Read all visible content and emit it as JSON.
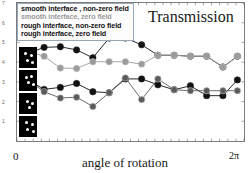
{
  "chart": {
    "title": "Transmission",
    "xlabel": "angle of rotation",
    "x_tick_min": "0",
    "x_tick_max": "2π",
    "ylabel": ""
  },
  "legend": {
    "entries": [
      {
        "label": "smooth interface ,  non-zero field",
        "color": "#111111"
      },
      {
        "label": "smooth interface, zero field",
        "color": "#9b9b9b"
      },
      {
        "label": "rough interface, non-zero field",
        "color": "#111111"
      },
      {
        "label": "rough interface, zero field",
        "color": "#4a4a4a"
      }
    ]
  },
  "insets": {
    "caption": "speckle-pattern thumbnails",
    "items": [
      {
        "name": "speckle-inset-1"
      },
      {
        "name": "speckle-inset-2"
      },
      {
        "name": "speckle-inset-3"
      },
      {
        "name": "speckle-inset-4"
      }
    ]
  },
  "chart_data": {
    "type": "line",
    "title": "Transmission",
    "xlabel": "angle of rotation",
    "ylabel": "",
    "xlim": [
      0,
      6.2832
    ],
    "ylim": [
      0,
      7
    ],
    "xticks": [
      0,
      6.2832
    ],
    "xticklabels": [
      "0",
      "2π"
    ],
    "yticks": [
      1,
      2,
      3,
      4,
      5,
      6,
      7
    ],
    "yticklabels": [
      "1",
      "2",
      "3",
      "4",
      "5",
      "6",
      "7"
    ],
    "grid": false,
    "legend_position": "upper-left",
    "x": [
      0.3,
      0.75,
      1.2,
      1.65,
      2.1,
      2.55,
      3.0,
      3.45,
      3.9,
      4.35,
      4.8,
      5.25,
      5.7,
      6.1
    ],
    "series": [
      {
        "name": "smooth interface ,  non-zero field",
        "color": "#111111",
        "marker": "circle",
        "values": [
          4.45,
          4.75,
          4.78,
          4.62,
          4.22,
          5.22,
          5.22,
          4.88,
          4.35,
          4.35,
          4.3,
          4.3,
          3.75,
          4.3
        ]
      },
      {
        "name": "smooth interface, zero field",
        "color": "#9b9b9b",
        "marker": "circle",
        "values": [
          4.55,
          4.3,
          3.7,
          3.68,
          4.02,
          4.02,
          4.02,
          3.9,
          4.35,
          4.35,
          4.3,
          4.3,
          3.75,
          4.3
        ]
      },
      {
        "name": "rough interface, non-zero field",
        "color": "#111111",
        "marker": "circle",
        "values": [
          3.1,
          2.62,
          2.72,
          2.92,
          2.5,
          2.45,
          3.15,
          3.15,
          2.85,
          2.6,
          2.8,
          2.3,
          2.3,
          3.1
        ]
      },
      {
        "name": "rough interface, zero field",
        "color": "#5a5a5a",
        "marker": "circle",
        "values": [
          3.1,
          2.5,
          2.18,
          2.22,
          1.75,
          2.45,
          3.2,
          2.1,
          3.15,
          2.6,
          2.55,
          2.55,
          2.55,
          2.55
        ]
      }
    ]
  }
}
